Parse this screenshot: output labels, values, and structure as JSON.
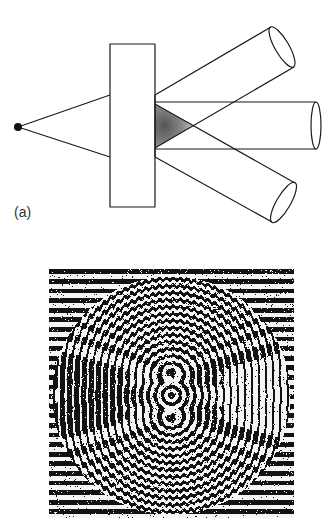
{
  "figure": {
    "panel_a": {
      "label": "(a)",
      "elements": [
        {
          "name": "point-source",
          "kind": "dot"
        },
        {
          "name": "hologram-plate",
          "kind": "rectangle"
        },
        {
          "name": "illumination-cone",
          "kind": "diverging-rays"
        },
        {
          "name": "beam-upper",
          "kind": "cylinder"
        },
        {
          "name": "beam-center",
          "kind": "cylinder"
        },
        {
          "name": "beam-lower",
          "kind": "cylinder"
        },
        {
          "name": "overlap-region",
          "kind": "shaded-triangle"
        }
      ]
    },
    "panel_b": {
      "kind": "interference-fringe-pattern",
      "description": "circular region of curved black/white fringes with three central lobes, surrounded by horizontal straight fringes"
    },
    "colors": {
      "ink": "#1a1a1a",
      "background": "#ffffff",
      "shade": "#7a7a7a"
    }
  }
}
